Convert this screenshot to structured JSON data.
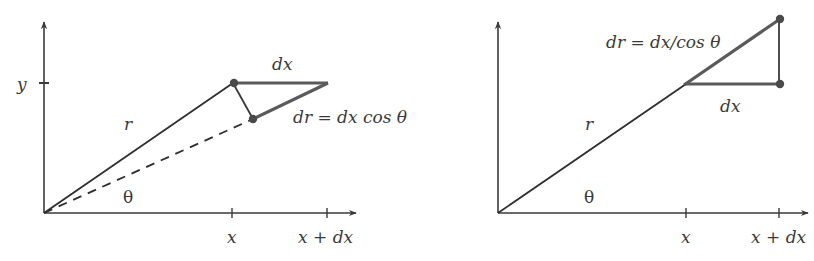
{
  "colors": {
    "axis": "#3a3a3a",
    "thin_line": "#2e2e2e",
    "thick_line": "#5a5a5a",
    "dot": "#4a4a4a",
    "text": "#3a3a3a",
    "background": "#ffffff"
  },
  "left_diagram": {
    "y_tick_label": "y",
    "x_tick_labels": [
      "x",
      "x + dx"
    ],
    "r_label": "r",
    "theta_label": "θ",
    "dx_label": "dx",
    "dr_label": "dr = dx cos θ"
  },
  "right_diagram": {
    "x_tick_labels": [
      "x",
      "x + dx"
    ],
    "r_label": "r",
    "theta_label": "θ",
    "dx_label": "dx",
    "dr_label": "dr = dx/cos θ"
  }
}
